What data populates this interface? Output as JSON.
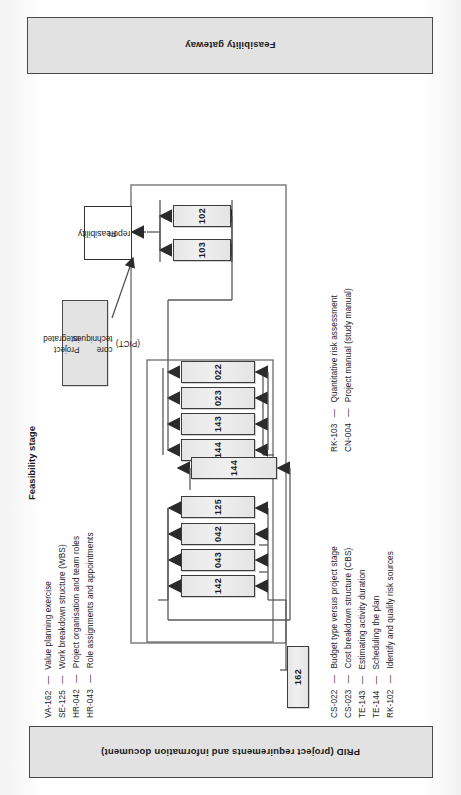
{
  "page": {
    "orientation": "rotated-90",
    "figure_type": "process-flow-diagram"
  },
  "banners": {
    "gateway": "Feasibility gateway",
    "prid": "PRID (project requirements and information document)"
  },
  "stage": {
    "title": "Feasibility stage"
  },
  "callout": {
    "line1": "Project integrated",
    "line2": "core techniques",
    "line3": "(PICT)"
  },
  "report": {
    "line1": "Feasibility",
    "line2": "report"
  },
  "nodes": {
    "input": {
      "label": "162"
    },
    "column_a": [
      {
        "label": "125"
      },
      {
        "label": "042"
      },
      {
        "label": "043"
      },
      {
        "label": "142"
      }
    ],
    "column_b": [
      {
        "label": "022"
      },
      {
        "label": "023"
      },
      {
        "label": "143"
      },
      {
        "label": "144"
      }
    ],
    "column_b_extra": {
      "label": "144"
    },
    "column_c": [
      {
        "label": "102"
      },
      {
        "label": "103"
      }
    ]
  },
  "legend_left": [
    {
      "code": "VA-162",
      "dash": "—",
      "text": "Value planning exercise"
    },
    {
      "code": "SE-125",
      "dash": "—",
      "text": "Work breakdown structure (WBS)"
    },
    {
      "code": "HR-042",
      "dash": "—",
      "text": "Project organisation and team roles"
    },
    {
      "code": "HR-043",
      "dash": "—",
      "text": "Role assignments and appointments"
    }
  ],
  "legend_right": [
    {
      "code": "CS-022",
      "dash": "—",
      "text": "Budget type versus project stage"
    },
    {
      "code": "CS-023",
      "dash": "—",
      "text": "Cost breakdown structure (CBS)"
    },
    {
      "code": "TE-143",
      "dash": "—",
      "text": "Estimating activity duration"
    },
    {
      "code": "TE-144",
      "dash": "—",
      "text": "Scheduling the plan"
    },
    {
      "code": "RK-102",
      "dash": "—",
      "text": "Identify and qualify risk sources"
    }
  ],
  "legend_far_right": [
    {
      "code": "RK-103",
      "dash": "—",
      "text": "Quantitative risk assessment"
    },
    {
      "code": "CN-004",
      "dash": "—",
      "text": "Project manual (study manual)"
    }
  ],
  "colors": {
    "node_fill": "#e8e8e8",
    "node_border": "#3c3c3c",
    "banner_fill": "#e2e2e2",
    "banner_border": "#4a4a4a",
    "wire": "#5a5a5a",
    "page": "#ffffff"
  }
}
